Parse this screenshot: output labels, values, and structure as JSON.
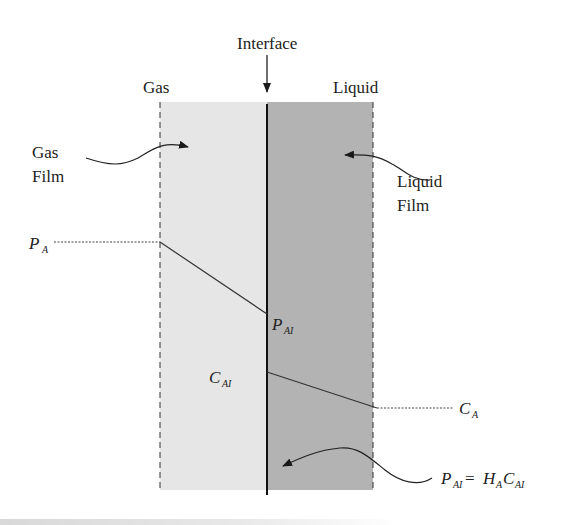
{
  "diagram": {
    "labels": {
      "interface": "Interface",
      "gas": "Gas",
      "liquid": "Liquid",
      "gas_film_line1": "Gas",
      "gas_film_line2": "Film",
      "liquid_film_line1": "Liquid",
      "liquid_film_line2": "Film"
    },
    "symbols": {
      "PA_main": "P",
      "PA_sub": "A",
      "PAI_main": "P",
      "PAI_sub": "AI",
      "CAI_main": "C",
      "CAI_sub": "AI",
      "CA_main": "C",
      "CA_sub": "A",
      "henry_P": "P",
      "henry_P_sub": "AI",
      "henry_eq": " = ",
      "henry_H": "H",
      "henry_H_sub": "A",
      "henry_C": "C",
      "henry_C_sub": "AI"
    },
    "colors": {
      "gas_film": "#e6e6e6",
      "liquid_film": "#b3b3b3",
      "lines": "#2a2a2a"
    }
  }
}
